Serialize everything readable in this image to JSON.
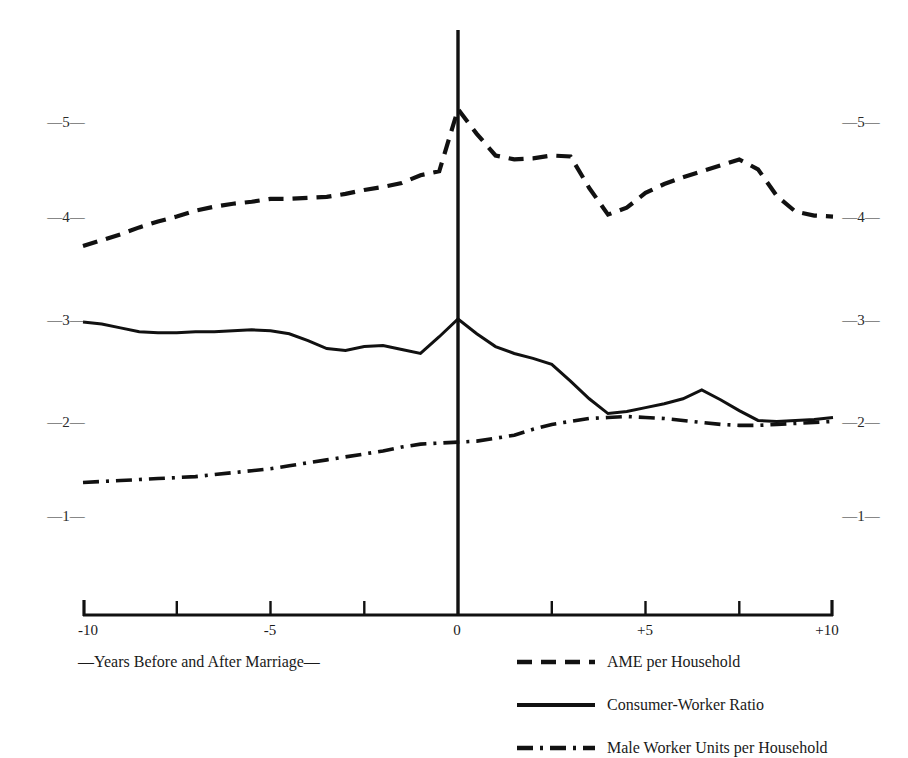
{
  "chart_data": {
    "type": "line",
    "title": "",
    "subtitle": "",
    "xlabel": "—Years Before and After Marriage—",
    "ylabel": "",
    "xlim": [
      -10,
      10
    ],
    "ylim": [
      0,
      5.6
    ],
    "grid": false,
    "legend_position": "bottom-right",
    "x_ticks_labeled": [
      "-10",
      "-5",
      "0",
      "+5",
      "+10"
    ],
    "x_ticks_labeled_values": [
      -10,
      -5,
      0,
      5,
      10
    ],
    "x_minor_ticks": [
      -7.5,
      -2.5,
      2.5,
      7.5
    ],
    "y_ticks_labeled": [
      "—5—",
      "—4—",
      "—3—",
      "—2—",
      "—1—"
    ],
    "y_ticks_values": [
      5,
      4,
      3,
      2,
      1
    ],
    "y_axis_duplicated_right": true,
    "vertical_marker_x": 0,
    "x": [
      -10,
      -9.5,
      -9,
      -8.5,
      -8,
      -7.5,
      -7,
      -6.5,
      -6,
      -5.5,
      -5,
      -4.5,
      -4,
      -3.5,
      -3,
      -2.5,
      -2,
      -1.5,
      -1,
      -0.5,
      0,
      0.5,
      1,
      1.5,
      2,
      2.5,
      3,
      3.5,
      4,
      4.5,
      5,
      5.5,
      6,
      6.5,
      7,
      7.5,
      8,
      8.5,
      9,
      9.5,
      10
    ],
    "series": [
      {
        "name": "AME per Household",
        "style": "dashed",
        "color": "#111111",
        "values": [
          3.74,
          3.8,
          3.86,
          3.93,
          3.99,
          4.04,
          4.1,
          4.14,
          4.17,
          4.19,
          4.22,
          4.22,
          4.23,
          4.24,
          4.27,
          4.31,
          4.34,
          4.38,
          4.46,
          4.5,
          5.13,
          4.88,
          4.66,
          4.62,
          4.63,
          4.66,
          4.65,
          4.33,
          4.06,
          4.13,
          4.28,
          4.37,
          4.44,
          4.5,
          4.56,
          4.62,
          4.52,
          4.25,
          4.09,
          4.05,
          4.04
        ]
      },
      {
        "name": "Consumer-Worker Ratio",
        "style": "solid",
        "color": "#111111",
        "values": [
          2.97,
          2.95,
          2.91,
          2.87,
          2.86,
          2.86,
          2.87,
          2.87,
          2.88,
          2.89,
          2.88,
          2.85,
          2.78,
          2.7,
          2.68,
          2.72,
          2.73,
          2.69,
          2.65,
          2.82,
          3.0,
          2.85,
          2.72,
          2.65,
          2.6,
          2.54,
          2.37,
          2.19,
          2.04,
          2.06,
          2.1,
          2.14,
          2.19,
          2.28,
          2.18,
          2.07,
          1.97,
          1.96,
          1.97,
          1.98,
          2.0
        ]
      },
      {
        "name": "Male Worker Units per Household",
        "style": "dashdot",
        "color": "#111111",
        "values": [
          1.34,
          1.35,
          1.36,
          1.37,
          1.38,
          1.39,
          1.4,
          1.42,
          1.44,
          1.46,
          1.48,
          1.51,
          1.54,
          1.57,
          1.6,
          1.63,
          1.66,
          1.7,
          1.73,
          1.74,
          1.75,
          1.76,
          1.79,
          1.82,
          1.88,
          1.93,
          1.96,
          1.99,
          2.0,
          2.01,
          2.0,
          1.99,
          1.97,
          1.95,
          1.93,
          1.92,
          1.92,
          1.93,
          1.94,
          1.95,
          1.96
        ]
      }
    ]
  },
  "axis": {
    "left_labels": [
      "—5—",
      "—4—",
      "—3—",
      "—2—",
      "—1—"
    ],
    "right_labels": [
      "—5—",
      "—4—",
      "—3—",
      "—2—",
      "—1—"
    ],
    "x_labels": [
      "-10",
      "-5",
      "0",
      "+5",
      "+10"
    ],
    "caption": "—Years Before and After Marriage—"
  },
  "legend": {
    "items": [
      {
        "label": "AME per Household",
        "style": "dashed"
      },
      {
        "label": "Consumer-Worker Ratio",
        "style": "solid"
      },
      {
        "label": "Male Worker Units per Household",
        "style": "dashdot"
      }
    ]
  }
}
